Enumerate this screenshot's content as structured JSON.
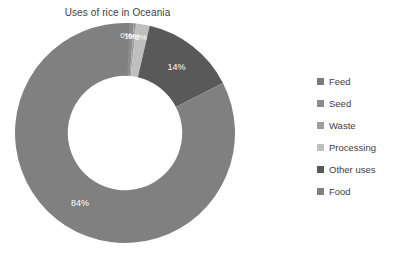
{
  "chart_data": {
    "type": "pie",
    "variant": "donut",
    "title": "Uses of rice in Oceania",
    "xlabel": "",
    "ylabel": "",
    "legend_position": "right",
    "grid": false,
    "units": "percent",
    "start_angle_deg": 0,
    "direction": "clockwise",
    "inner_radius_ratio": 0.52,
    "categories": [
      "Feed",
      "Seed",
      "Waste",
      "Processing",
      "Other uses",
      "Food"
    ],
    "values": [
      0,
      1,
      0,
      2,
      14,
      84
    ],
    "labels": [
      "0%",
      "1%",
      "0%",
      "2%",
      "14%",
      "84%"
    ],
    "colors": [
      "#7a7a7a",
      "#8c8c8c",
      "#9e9e9e",
      "#bfbfbf",
      "#595959",
      "#808080"
    ],
    "slices": [
      {
        "name": "Feed",
        "value": 0,
        "label": "0%",
        "color": "#7a7a7a"
      },
      {
        "name": "Seed",
        "value": 1,
        "label": "1%",
        "color": "#8c8c8c"
      },
      {
        "name": "Waste",
        "value": 0,
        "label": "0%",
        "color": "#9e9e9e"
      },
      {
        "name": "Processing",
        "value": 2,
        "label": "2%",
        "color": "#bfbfbf"
      },
      {
        "name": "Other uses",
        "value": 14,
        "label": "14%",
        "color": "#595959"
      },
      {
        "name": "Food",
        "value": 84,
        "label": "84%",
        "color": "#808080"
      }
    ]
  },
  "legend": {
    "items": [
      {
        "label": "Feed",
        "color": "#7a7a7a"
      },
      {
        "label": "Seed",
        "color": "#8c8c8c"
      },
      {
        "label": "Waste",
        "color": "#9e9e9e"
      },
      {
        "label": "Processing",
        "color": "#bfbfbf"
      },
      {
        "label": "Other uses",
        "color": "#595959"
      },
      {
        "label": "Food",
        "color": "#808080"
      }
    ]
  },
  "canvas": {
    "background": "#ffffff",
    "text_color": "#404040",
    "label_text_color": "#ffffff"
  }
}
